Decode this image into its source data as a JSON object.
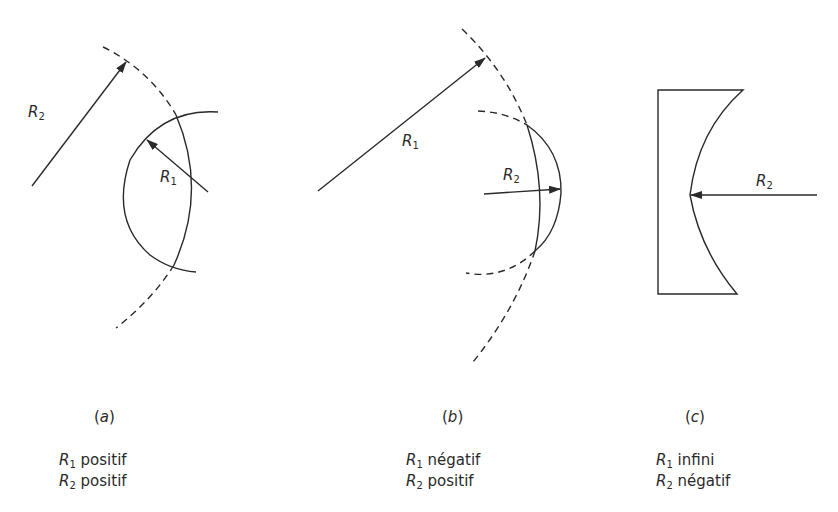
{
  "figure": {
    "stroke_color": "#2a2a2a",
    "panels": [
      {
        "id": "a",
        "letter": "a",
        "labels": {
          "r_outer": {
            "sym": "R",
            "sub": "2"
          },
          "r_inner": {
            "sym": "R",
            "sub": "1"
          }
        },
        "caption": [
          {
            "sym": "R",
            "sub": "1",
            "text": " positif"
          },
          {
            "sym": "R",
            "sub": "2",
            "text": " positif"
          }
        ]
      },
      {
        "id": "b",
        "letter": "b",
        "labels": {
          "r_outer": {
            "sym": "R",
            "sub": "1"
          },
          "r_inner": {
            "sym": "R",
            "sub": "2"
          }
        },
        "caption": [
          {
            "sym": "R",
            "sub": "1",
            "text": " négatif"
          },
          {
            "sym": "R",
            "sub": "2",
            "text": " positif"
          }
        ]
      },
      {
        "id": "c",
        "letter": "c",
        "labels": {
          "r_inner": {
            "sym": "R",
            "sub": "2"
          }
        },
        "caption": [
          {
            "sym": "R",
            "sub": "1",
            "text": " infini"
          },
          {
            "sym": "R",
            "sub": "2",
            "text": " négatif"
          }
        ]
      }
    ]
  }
}
